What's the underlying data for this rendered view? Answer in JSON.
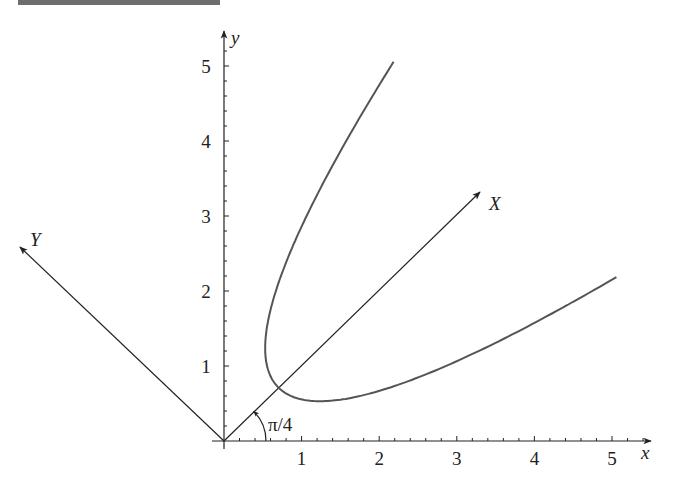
{
  "figure": {
    "banner_color": "#6e6e6e"
  },
  "chart_data": {
    "type": "line",
    "title": "",
    "xlabel": "x",
    "ylabel": "y",
    "xlim": [
      0,
      5.5
    ],
    "ylim": [
      0,
      5.5
    ],
    "grid": false,
    "x_ticks": [
      "1",
      "2",
      "3",
      "4",
      "5"
    ],
    "y_ticks": [
      "1",
      "2",
      "3",
      "4",
      "5"
    ],
    "minor_tick_step": 0.2,
    "rotated_axes": {
      "angle_label": "π/4",
      "angle_radians": 0.7853981634,
      "X_label": "X",
      "Y_label": "Y"
    },
    "series": [
      {
        "name": "rotated parabola X = Y² + 1",
        "equation_rotated": "X = Y^2 + 1",
        "Y_range": [
          -2.03,
          2.03
        ],
        "sample_points_xy": [
          [
            2.15,
            5.02
          ],
          [
            0.54,
            1.25
          ],
          [
            0.71,
            0.71
          ],
          [
            1.25,
            0.54
          ],
          [
            5.02,
            2.15
          ]
        ],
        "color": "#555555"
      }
    ],
    "axis_color": "#222222"
  }
}
